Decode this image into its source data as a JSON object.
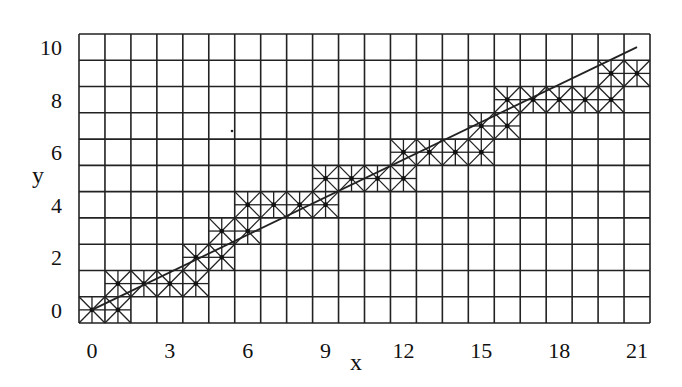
{
  "diagram": {
    "type": "adaptive-grid-refinement",
    "x_axis": {
      "label": "x",
      "ticks": [
        "0",
        "3",
        "6",
        "9",
        "12",
        "15",
        "18",
        "21"
      ],
      "tick_values": [
        0,
        3,
        6,
        9,
        12,
        15,
        18,
        21
      ]
    },
    "y_axis": {
      "label": "y",
      "ticks": [
        "0",
        "2",
        "4",
        "6",
        "8",
        "10"
      ],
      "tick_values": [
        0,
        2,
        4,
        6,
        8,
        10
      ]
    },
    "grid": {
      "columns": 22,
      "rows": 11,
      "line_color": "#222222"
    },
    "line": {
      "from": [
        0,
        0
      ],
      "to": [
        21,
        10
      ],
      "color": "#222222"
    },
    "refined_cells": [
      [
        0,
        0
      ],
      [
        1,
        0
      ],
      [
        1,
        1
      ],
      [
        2,
        1
      ],
      [
        3,
        1
      ],
      [
        4,
        1
      ],
      [
        4,
        2
      ],
      [
        5,
        2
      ],
      [
        5,
        3
      ],
      [
        6,
        3
      ],
      [
        6,
        4
      ],
      [
        7,
        4
      ],
      [
        8,
        4
      ],
      [
        9,
        4
      ],
      [
        9,
        5
      ],
      [
        10,
        5
      ],
      [
        11,
        5
      ],
      [
        12,
        5
      ],
      [
        12,
        6
      ],
      [
        13,
        6
      ],
      [
        14,
        6
      ],
      [
        15,
        6
      ],
      [
        15,
        7
      ],
      [
        16,
        7
      ],
      [
        16,
        8
      ],
      [
        17,
        8
      ],
      [
        18,
        8
      ],
      [
        19,
        8
      ],
      [
        20,
        8
      ],
      [
        20,
        9
      ],
      [
        21,
        9
      ]
    ]
  }
}
